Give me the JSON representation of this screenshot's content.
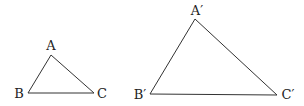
{
  "figure": {
    "triangles": [
      {
        "name": "ABC",
        "vertices": [
          {
            "label": "A",
            "x": 51,
            "y": 55,
            "label_x": 51,
            "label_y": 50
          },
          {
            "label": "B",
            "x": 28,
            "y": 93,
            "label_x": 19,
            "label_y": 98
          },
          {
            "label": "C",
            "x": 94,
            "y": 93,
            "label_x": 102,
            "label_y": 98
          }
        ]
      },
      {
        "name": "A'B'C'",
        "vertices": [
          {
            "label": "A′",
            "x": 195,
            "y": 19,
            "label_x": 197,
            "label_y": 15
          },
          {
            "label": "B′",
            "x": 150,
            "y": 94,
            "label_x": 139,
            "label_y": 99
          },
          {
            "label": "C′",
            "x": 277,
            "y": 95,
            "label_x": 287,
            "label_y": 99
          }
        ]
      }
    ]
  },
  "colors": {
    "stroke": "#333333",
    "text": "#222222",
    "background": "#ffffff"
  }
}
